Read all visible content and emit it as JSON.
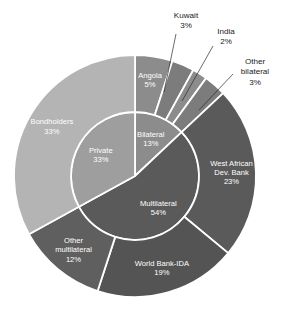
{
  "chart_data": {
    "type": "pie",
    "title": "",
    "subtitle": "",
    "xlabel": "",
    "ylabel": "",
    "legend_position": "none",
    "grid": false,
    "units": "%",
    "start_angle_deg": 0,
    "direction": "clockwise",
    "center": {
      "x": 135,
      "y": 176
    },
    "inner_ring": {
      "name": "Creditor category",
      "radius_inner": 0,
      "radius_outer": 64,
      "slices": [
        {
          "label": "Bilateral",
          "value": 13,
          "value_text": "13%",
          "color": "#8c8c8c",
          "text_color": "#ffffff"
        },
        {
          "label": "Multilateral",
          "value": 54,
          "value_text": "54%",
          "color": "#5a5a5a",
          "text_color": "#ffffff"
        },
        {
          "label": "Private",
          "value": 33,
          "value_text": "33%",
          "color": "#9e9e9e",
          "text_color": "#ffffff"
        }
      ]
    },
    "outer_ring": {
      "name": "Creditor",
      "radius_inner": 64,
      "radius_outer": 121,
      "slices": [
        {
          "label": "Angola",
          "value": 5,
          "value_text": "5%",
          "color": "#8c8c8c",
          "text_color": "#ffffff",
          "parent": "Bilateral",
          "callout": false
        },
        {
          "label": "Kuwait",
          "value": 3,
          "value_text": "3%",
          "color": "#7c7c7c",
          "text_color": "#1b1b1b",
          "parent": "Bilateral",
          "callout": true
        },
        {
          "label": "India",
          "value": 2,
          "value_text": "2%",
          "color": "#8c8c8c",
          "text_color": "#1b1b1b",
          "parent": "Bilateral",
          "callout": true
        },
        {
          "label": "Other bilateral",
          "value": 3,
          "value_text": "3%",
          "color": "#7c7c7c",
          "text_color": "#1b1b1b",
          "parent": "Bilateral",
          "callout": true
        },
        {
          "label": "West African Dev. Bank",
          "value": 23,
          "value_text": "23%",
          "color": "#5a5a5a",
          "text_color": "#ffffff",
          "parent": "Multilateral",
          "callout": false
        },
        {
          "label": "World Bank-IDA",
          "value": 19,
          "value_text": "19%",
          "color": "#545454",
          "text_color": "#ffffff",
          "parent": "Multilateral",
          "callout": false
        },
        {
          "label": "Other multilateral",
          "value": 12,
          "value_text": "12%",
          "color": "#5f5f5f",
          "text_color": "#ffffff",
          "parent": "Multilateral",
          "callout": false
        },
        {
          "label": "Bondholders",
          "value": 33,
          "value_text": "33%",
          "color": "#b4b4b4",
          "text_color": "#ffffff",
          "parent": "Private",
          "callout": false
        }
      ]
    },
    "callouts": [
      {
        "label": "Kuwait",
        "value_text": "3%",
        "text_x": 186,
        "text_y": 16,
        "line_from_x": 176,
        "line_from_y": 34,
        "line_to_x": 164,
        "line_to_y": 92
      },
      {
        "label": "India",
        "value_text": "2%",
        "text_x": 226,
        "text_y": 32,
        "line_from_x": 213,
        "line_from_y": 46,
        "line_to_x": 182,
        "line_to_y": 101
      },
      {
        "label": "Other bilateral",
        "value_text": "3%",
        "text_x": 255,
        "text_y": 62,
        "line_from_x": 233,
        "line_from_y": 74,
        "line_to_x": 199,
        "line_to_y": 110
      }
    ],
    "separator_color": "#ffffff",
    "separator_width": 1.8,
    "background": "#ffffff"
  }
}
